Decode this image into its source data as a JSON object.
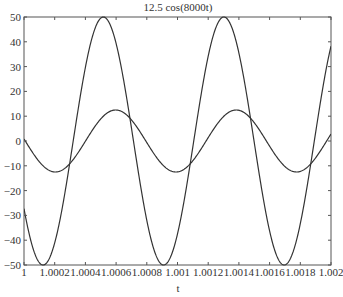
{
  "chart_data": {
    "type": "line",
    "title": "12.5 cos(8000t)",
    "xlabel": "t",
    "ylabel": "",
    "xlim": [
      1,
      1.002
    ],
    "ylim": [
      -50,
      50
    ],
    "grid": false,
    "legend": null,
    "xticks": [
      1,
      1.0002,
      1.0004,
      1.0006,
      1.0008,
      1.001,
      1.0012,
      1.0014,
      1.0016,
      1.0018,
      1.002
    ],
    "xtick_labels": [
      "1",
      "1.0002",
      "1.0004",
      "1.0006",
      "1.0008",
      "1.001",
      "1.0012",
      "1.0014",
      "1.0016",
      "1.0018",
      "1.002"
    ],
    "yticks": [
      50,
      40,
      30,
      20,
      10,
      0,
      -10,
      -20,
      -30,
      -40,
      -50
    ],
    "ytick_labels": [
      "50",
      "40",
      "30",
      "20",
      "10",
      "0",
      "−10",
      "−20",
      "−30",
      "−40",
      "−50"
    ],
    "series": [
      {
        "name": "50 cos(8000t + 36.87°)",
        "amplitude": 50,
        "omega": 8000,
        "phase_rad": 0.6435,
        "color": "#333333",
        "sample_points": [
          [
            1,
            -27
          ],
          [
            1.00016,
            -50
          ],
          [
            1.000515,
            50
          ],
          [
            1.00091,
            -50
          ],
          [
            1.0013,
            50
          ],
          [
            1.0017,
            -50
          ],
          [
            1.002,
            38.5
          ]
        ]
      },
      {
        "name": "12.5 cos(8000t)",
        "amplitude": 12.5,
        "omega": 8000,
        "phase_rad": 0,
        "color": "#333333",
        "sample_points": [
          [
            1,
            0.9
          ],
          [
            1.000205,
            -12.5
          ],
          [
            1.000598,
            12.5
          ],
          [
            1.00099,
            -12.5
          ],
          [
            1.00138,
            12.5
          ],
          [
            1.00177,
            -12.5
          ],
          [
            1.002,
            2.8
          ]
        ]
      }
    ]
  },
  "colors": {
    "axis": "#555555",
    "line": "#333333",
    "background": "#ffffff"
  }
}
